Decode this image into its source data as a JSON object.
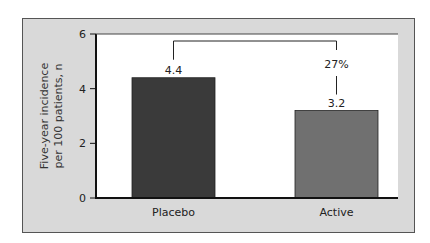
{
  "chart_data": {
    "type": "bar",
    "title": "",
    "xlabel": "",
    "ylabel_lines": [
      "Five-year incidence",
      "per 100 patients, n"
    ],
    "ylabel": "Five-year incidence per 100 patients, n",
    "categories": [
      "Placebo",
      "Active"
    ],
    "values": [
      4.4,
      3.2
    ],
    "data_labels": [
      "4.4",
      "3.2"
    ],
    "bar_colors": [
      "#3a3a3a",
      "#707070"
    ],
    "ylim": [
      0,
      6
    ],
    "yticks": [
      0,
      2,
      4,
      6
    ],
    "grid": false,
    "legend": null,
    "annotation": {
      "text": "27%",
      "type": "bracket",
      "from": "Placebo",
      "to": "Active",
      "meaning": "relative reduction"
    }
  }
}
